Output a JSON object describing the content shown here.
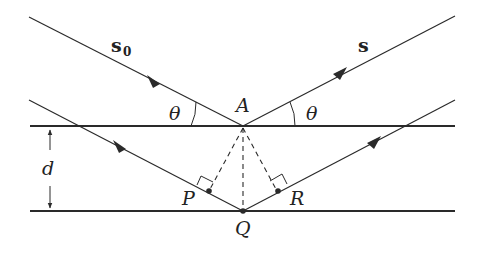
{
  "diagram": {
    "labels": {
      "incident_vector": "s",
      "incident_subscript": "0",
      "scattered_vector": "s",
      "angle_left": "θ",
      "angle_right": "θ",
      "point_A": "A",
      "point_P": "P",
      "point_Q": "Q",
      "point_R": "R",
      "spacing": "d"
    },
    "colors": {
      "line": "#2a2a2a",
      "background": "#ffffff"
    }
  }
}
